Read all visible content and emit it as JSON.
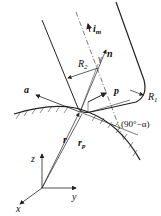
{
  "diagram": {
    "type": "tool-surface contact geometry",
    "labels": {
      "i_m": "i",
      "i_m_sub": "m",
      "n": "n",
      "gamma": "γ",
      "R2": "R",
      "R2_sub": "2",
      "R1": "R",
      "R1_sub": "1",
      "a": "a",
      "p": "p",
      "r": "r",
      "r_p": "r",
      "r_p_sub": "p",
      "angle": "(90°−α)",
      "z": "z",
      "y": "y",
      "x": "x"
    },
    "colors": {
      "line": "#222222",
      "background": "#ffffff"
    }
  }
}
